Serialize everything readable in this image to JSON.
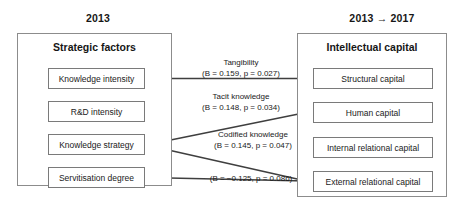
{
  "headings": {
    "left": "2013",
    "right": "2013 → 2017"
  },
  "groups": {
    "left": {
      "title": "Strategic factors",
      "nodes": [
        {
          "label": "Knowledge intensity"
        },
        {
          "label": "R&D intensity"
        },
        {
          "label": "Knowledge strategy"
        },
        {
          "label": "Servitisation degree"
        }
      ]
    },
    "right": {
      "title": "Intellectual capital",
      "nodes": [
        {
          "label": "Structural capital"
        },
        {
          "label": "Human capital"
        },
        {
          "label": "Internal relational capital"
        },
        {
          "label": "External relational capital"
        }
      ]
    }
  },
  "edges": [
    {
      "name": "Tangibility",
      "stat": "(B = 0.159, p = 0.027)",
      "from": "Knowledge intensity",
      "to": "Structural capital",
      "beta": 0.159,
      "p": 0.027
    },
    {
      "name": "Tacit knowledge",
      "stat": "(B = 0.148, p = 0.034)",
      "from": "Knowledge strategy",
      "to": "Human capital",
      "beta": 0.148,
      "p": 0.034
    },
    {
      "name": "Codified knowledge",
      "stat": "(B = 0.145, p = 0.047)",
      "from": "Knowledge strategy",
      "to": "External relational capital",
      "beta": 0.145,
      "p": 0.047
    },
    {
      "name": "",
      "stat": "(B = −0.125, p = 0.086)",
      "from": "Servitisation degree",
      "to": "External relational capital",
      "beta": -0.125,
      "p": 0.086
    }
  ],
  "colors": {
    "line": "#3f3f3f",
    "group_border": "#8c8c8c",
    "node_border": "#7a7a7a",
    "text": "#1a1a1a",
    "background": "#ffffff"
  }
}
